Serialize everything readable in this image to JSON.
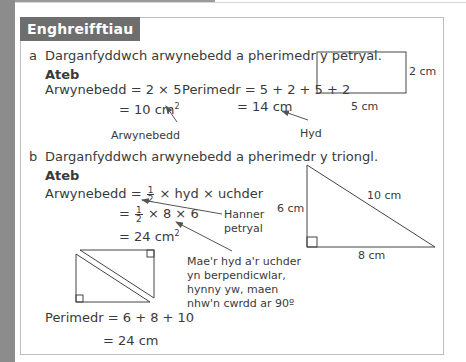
{
  "header": {
    "title": "Enghreifftiau"
  },
  "example_a": {
    "letter": "a",
    "question": "Darganfyddwch arwynebedd a pherimedr y petryal.",
    "answer_label": "Ateb",
    "area_line1": "Arwynebedd = 2 × 5",
    "area_line2_prefix": "= 10 cm",
    "area_unit_power": "2",
    "perimeter_line1": "Perimedr = 5 + 2 + 5 + 2",
    "perimeter_line2": "= 14 cm",
    "annotation_area": "Arwynebedd",
    "annotation_length": "Hyd",
    "rectangle": {
      "width_label": "5 cm",
      "height_label": "2 cm"
    }
  },
  "example_b": {
    "letter": "b",
    "question": "Darganfyddwch arwynebedd a pherimedr y triongl.",
    "answer_label": "Ateb",
    "area_line1_prefix": "Arwynebedd = ",
    "half_num": "1",
    "half_den": "2",
    "area_line1_suffix": "× hyd × uchder",
    "area_line2_prefix": "=",
    "area_line2_suffix": "× 8 × 6",
    "area_line3_prefix": "= 24 cm",
    "area_unit_power": "2",
    "annotation_half_rect_1": "Hanner",
    "annotation_half_rect_2": "petryal",
    "annotation_perp_1": "Mae'r hyd a'r uchder",
    "annotation_perp_2": "yn berpendicwlar,",
    "annotation_perp_3": "hynny yw, maen",
    "annotation_perp_4": "nhw'n cwrdd ar 90º",
    "perimeter_line1": "Perimedr = 6 + 8 + 10",
    "perimeter_line2": "= 24 cm",
    "triangle": {
      "height_label": "6 cm",
      "base_label": "8 cm",
      "hypotenuse_label": "10 cm"
    }
  },
  "colors": {
    "badge_bg": "#6e6e6e",
    "text": "#3a3a3a",
    "border": "#bdbdbd",
    "left_strip": "#8c8c8c"
  }
}
